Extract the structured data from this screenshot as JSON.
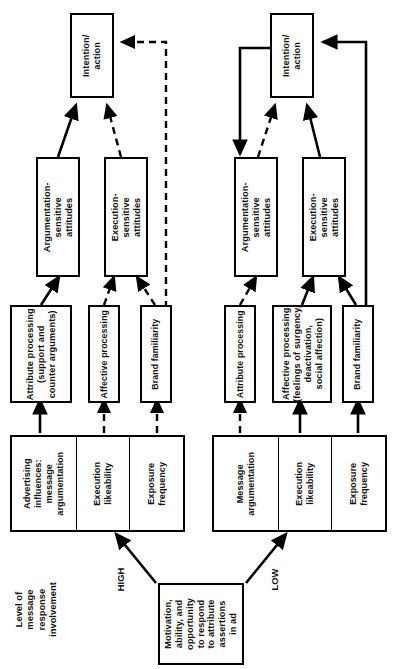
{
  "diagram": {
    "title_label": "Level of\nmessage\nresponse\ninvolvement",
    "root": {
      "label": "Motivation,\nability, and\nopportunity\nto respond\nto attribute\nassertions\nin ad"
    },
    "branch_labels": {
      "high": "HIGH",
      "low": "LOW"
    },
    "high_branch": {
      "inputs": {
        "message": "Advertising\ninfluences:\nmessage\nargumentation",
        "execution": "Execution\nlikeability",
        "exposure": "Exposure\nfrequency"
      },
      "processing": {
        "attribute": "Attribute processing\n(support and\ncounter arguments)",
        "affective": "Affective processing",
        "brand": "Brand familiarity"
      },
      "attitudes": {
        "argumentation": "Argumentation-\nsensitive\nattitudes",
        "execution": "Execution-\nsensitive\nattitudes"
      },
      "outcome": "Intention/\naction"
    },
    "low_branch": {
      "inputs": {
        "message": "Message\nargumentation",
        "execution": "Execution\nlikeability",
        "exposure": "Exposure\nfrequency"
      },
      "processing": {
        "attribute": "Attribute processing",
        "affective": "Affective processing\n(feelings of surgency,\ndeactivation,\nsocial affection)",
        "brand": "Brand familiarity"
      },
      "attitudes": {
        "argumentation": "Argumentation-\nsensitive\nattitudes",
        "execution": "Execution-\nsensitive\nattitudes"
      },
      "outcome": "Intention/\naction"
    },
    "colors": {
      "stroke": "#000000",
      "background": "#ffffff"
    }
  }
}
